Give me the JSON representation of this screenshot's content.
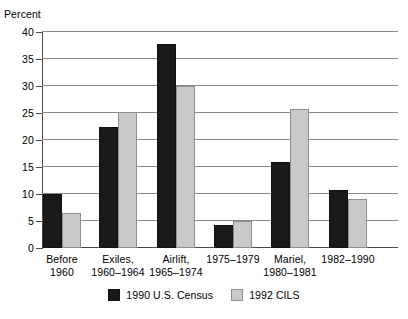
{
  "chart_data": {
    "type": "bar",
    "title": "",
    "xlabel": "",
    "ylabel": "Percent",
    "ylim": [
      0,
      40
    ],
    "yticks": [
      0,
      5,
      10,
      15,
      20,
      25,
      30,
      35,
      40
    ],
    "ytick_labels": [
      "0",
      "5",
      "10",
      "15",
      "20",
      "25",
      "30",
      "35",
      "40"
    ],
    "grid": true,
    "legend_position": "bottom-center",
    "categories": [
      "Before\n1960",
      "Exiles,\n1960–1964",
      "Airlift,\n1965–1974",
      "1975–1979",
      "Mariel,\n1980–1981",
      "1982–1990"
    ],
    "category_lines": [
      [
        "Before",
        "1960"
      ],
      [
        "Exiles,",
        "1960–1964"
      ],
      [
        "Airlift,",
        "1965–1974"
      ],
      [
        "1975–1979",
        ""
      ],
      [
        "Mariel,",
        "1980–1981"
      ],
      [
        "1982–1990",
        ""
      ]
    ],
    "series": [
      {
        "name": "1990 U.S. Census",
        "color": "#1a1a1a",
        "values": [
          10.0,
          22.5,
          37.8,
          4.2,
          16.0,
          10.7
        ]
      },
      {
        "name": "1992 CILS",
        "color": "#c9c9c9",
        "values": [
          6.5,
          25.2,
          30.0,
          5.0,
          25.7,
          9.0
        ]
      }
    ]
  },
  "axis": {
    "y_title": "Percent"
  },
  "legend": {
    "items": [
      {
        "label": "1990 U.S. Census",
        "swatch": "black-square-swatch"
      },
      {
        "label": "1992 CILS",
        "swatch": "gray-square-swatch"
      }
    ]
  }
}
